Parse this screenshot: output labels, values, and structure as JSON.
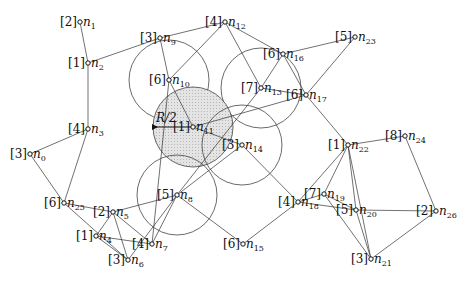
{
  "diagram": {
    "annotation": "R/2",
    "nodes": [
      {
        "id": "n0",
        "name": "n",
        "sub": "0",
        "tag": "[3]",
        "x": 30,
        "y": 154
      },
      {
        "id": "n1",
        "name": "n",
        "sub": "1",
        "tag": "[2]",
        "x": 80,
        "y": 22
      },
      {
        "id": "n2",
        "name": "n",
        "sub": "2",
        "tag": "[1]",
        "x": 88,
        "y": 63
      },
      {
        "id": "n3",
        "name": "n",
        "sub": "3",
        "tag": "[4]",
        "x": 88,
        "y": 129
      },
      {
        "id": "n4",
        "name": "n",
        "sub": "4",
        "tag": "[1]",
        "x": 96,
        "y": 236
      },
      {
        "id": "n5",
        "name": "n",
        "sub": "5",
        "tag": "[2]",
        "x": 113,
        "y": 212
      },
      {
        "id": "n6",
        "name": "n",
        "sub": "6",
        "tag": "[3]",
        "x": 128,
        "y": 260
      },
      {
        "id": "n7",
        "name": "n",
        "sub": "7",
        "tag": "[4]",
        "x": 152,
        "y": 244
      },
      {
        "id": "n8",
        "name": "n",
        "sub": "8",
        "tag": "[5]",
        "x": 177,
        "y": 195
      },
      {
        "id": "n9",
        "name": "n",
        "sub": "9",
        "tag": "[3]",
        "x": 160,
        "y": 38
      },
      {
        "id": "n10",
        "name": "n",
        "sub": "10",
        "tag": "[6]",
        "x": 169,
        "y": 80
      },
      {
        "id": "n11",
        "name": "n",
        "sub": "11",
        "tag": "[1]",
        "x": 193,
        "y": 127
      },
      {
        "id": "n12",
        "name": "n",
        "sub": "12",
        "tag": "[4]",
        "x": 225,
        "y": 22
      },
      {
        "id": "n13",
        "name": "n",
        "sub": "13",
        "tag": "[7]",
        "x": 261,
        "y": 88
      },
      {
        "id": "n14",
        "name": "n",
        "sub": "14",
        "tag": "[3]",
        "x": 242,
        "y": 145
      },
      {
        "id": "n15",
        "name": "n",
        "sub": "15",
        "tag": "[6]",
        "x": 243,
        "y": 244
      },
      {
        "id": "n16",
        "name": "n",
        "sub": "16",
        "tag": "[6]",
        "x": 283,
        "y": 54
      },
      {
        "id": "n17",
        "name": "n",
        "sub": "17",
        "tag": "[6]",
        "x": 306,
        "y": 95
      },
      {
        "id": "n18",
        "name": "n",
        "sub": "18",
        "tag": "[4]",
        "x": 298,
        "y": 202
      },
      {
        "id": "n19",
        "name": "n",
        "sub": "19",
        "tag": "[7]",
        "x": 324,
        "y": 194
      },
      {
        "id": "n20",
        "name": "n",
        "sub": "20",
        "tag": "[5]",
        "x": 356,
        "y": 210
      },
      {
        "id": "n21",
        "name": "n",
        "sub": "21",
        "tag": "[3]",
        "x": 371,
        "y": 259
      },
      {
        "id": "n22",
        "name": "n",
        "sub": "22",
        "tag": "[1]",
        "x": 348,
        "y": 145
      },
      {
        "id": "n23",
        "name": "n",
        "sub": "23",
        "tag": "[5]",
        "x": 355,
        "y": 37
      },
      {
        "id": "n24",
        "name": "n",
        "sub": "24",
        "tag": "[8]",
        "x": 405,
        "y": 136
      },
      {
        "id": "n25",
        "name": "n",
        "sub": "25",
        "tag": "[6]",
        "x": 64,
        "y": 203
      },
      {
        "id": "n26",
        "name": "n",
        "sub": "26",
        "tag": "[2]",
        "x": 436,
        "y": 211
      }
    ],
    "edges": [
      [
        "n1",
        "n2"
      ],
      [
        "n2",
        "n3"
      ],
      [
        "n2",
        "n9"
      ],
      [
        "n3",
        "n0"
      ],
      [
        "n3",
        "n25"
      ],
      [
        "n0",
        "n25"
      ],
      [
        "n25",
        "n5"
      ],
      [
        "n25",
        "n6"
      ],
      [
        "n5",
        "n4"
      ],
      [
        "n5",
        "n6"
      ],
      [
        "n5",
        "n7"
      ],
      [
        "n5",
        "n8"
      ],
      [
        "n4",
        "n7"
      ],
      [
        "n4",
        "n6"
      ],
      [
        "n6",
        "n8"
      ],
      [
        "n7",
        "n8"
      ],
      [
        "n8",
        "n15"
      ],
      [
        "n8",
        "n14"
      ],
      [
        "n9",
        "n12"
      ],
      [
        "n9",
        "n10"
      ],
      [
        "n10",
        "n12"
      ],
      [
        "n10",
        "n7"
      ],
      [
        "n10",
        "n11"
      ],
      [
        "n11",
        "n14"
      ],
      [
        "n11",
        "n17"
      ],
      [
        "n12",
        "n16"
      ],
      [
        "n12",
        "n13"
      ],
      [
        "n13",
        "n17"
      ],
      [
        "n13",
        "n16"
      ],
      [
        "n13",
        "n8"
      ],
      [
        "n16",
        "n23"
      ],
      [
        "n16",
        "n17"
      ],
      [
        "n17",
        "n23"
      ],
      [
        "n17",
        "n22"
      ],
      [
        "n14",
        "n18"
      ],
      [
        "n15",
        "n18"
      ],
      [
        "n18",
        "n19"
      ],
      [
        "n18",
        "n22"
      ],
      [
        "n18",
        "n20"
      ],
      [
        "n19",
        "n22"
      ],
      [
        "n19",
        "n20"
      ],
      [
        "n19",
        "n21"
      ],
      [
        "n20",
        "n22"
      ],
      [
        "n20",
        "n21"
      ],
      [
        "n20",
        "n26"
      ],
      [
        "n22",
        "n24"
      ],
      [
        "n24",
        "n26"
      ],
      [
        "n26",
        "n21"
      ],
      [
        "n22",
        "n21"
      ]
    ],
    "circles": [
      {
        "center": "n10",
        "r": 40,
        "shaded": false
      },
      {
        "center": "n13",
        "r": 40,
        "shaded": false
      },
      {
        "center": "n11",
        "r": 40,
        "shaded": true
      },
      {
        "center": "n14",
        "r": 40,
        "shaded": false
      },
      {
        "center": "n8",
        "r": 40,
        "shaded": false
      }
    ],
    "arrow": {
      "from": "n11",
      "to_x": 153,
      "label_x": 156,
      "label_y": 122
    }
  }
}
